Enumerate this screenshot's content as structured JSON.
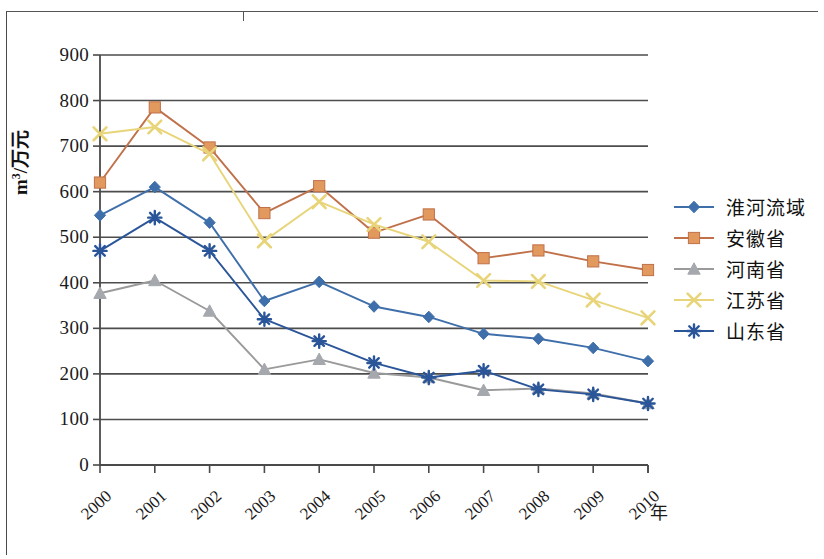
{
  "chart_data": {
    "type": "line",
    "title": "",
    "xlabel": "年",
    "ylabel": "m³/万元",
    "categories": [
      "2000",
      "2001",
      "2002",
      "2003",
      "2004",
      "2005",
      "2006",
      "2007",
      "2008",
      "2009",
      "2010"
    ],
    "x": [
      2000,
      2001,
      2002,
      2003,
      2004,
      2005,
      2006,
      2007,
      2008,
      2009,
      2010
    ],
    "ylim": [
      0,
      900
    ],
    "xlim": [
      2000,
      2010
    ],
    "y_ticks": [
      0,
      100,
      200,
      300,
      400,
      500,
      600,
      700,
      800,
      900
    ],
    "grid": "horizontal",
    "legend_position": "right",
    "series": [
      {
        "name": "淮河流域",
        "color": "#3f6fab",
        "marker": "diamond",
        "values": [
          548,
          610,
          532,
          360,
          402,
          348,
          325,
          288,
          277,
          257,
          228
        ]
      },
      {
        "name": "安徽省",
        "color": "#c0714a",
        "marker": "square",
        "marker_fill": "#e2995e",
        "values": [
          620,
          785,
          697,
          553,
          612,
          510,
          550,
          454,
          471,
          447,
          428
        ]
      },
      {
        "name": "河南省",
        "color": "#9a9a9a",
        "marker": "triangle",
        "marker_fill": "#a5a8ad",
        "values": [
          377,
          405,
          338,
          210,
          232,
          202,
          192,
          164,
          168,
          157,
          135
        ]
      },
      {
        "name": "江苏省",
        "color": "#e8d479",
        "marker": "cross",
        "values": [
          727,
          742,
          683,
          492,
          578,
          528,
          490,
          405,
          403,
          362,
          323
        ]
      },
      {
        "name": "山东省",
        "color": "#2a5699",
        "marker": "asterisk",
        "values": [
          470,
          543,
          470,
          320,
          272,
          224,
          192,
          207,
          166,
          155,
          135
        ]
      }
    ]
  },
  "axes": {
    "y_title_prefix": "m",
    "y_title_sup": "3",
    "y_title_suffix": "/万元",
    "x_title": "年"
  },
  "colors": {
    "series_1": "#3f6fab",
    "series_2": "#c0714a",
    "series_3": "#9a9a9a",
    "series_4": "#e8d479",
    "series_5": "#2a5699",
    "axis": "#4a4a4a",
    "gridline": "#4d4d4d",
    "background": "#ffffff"
  }
}
